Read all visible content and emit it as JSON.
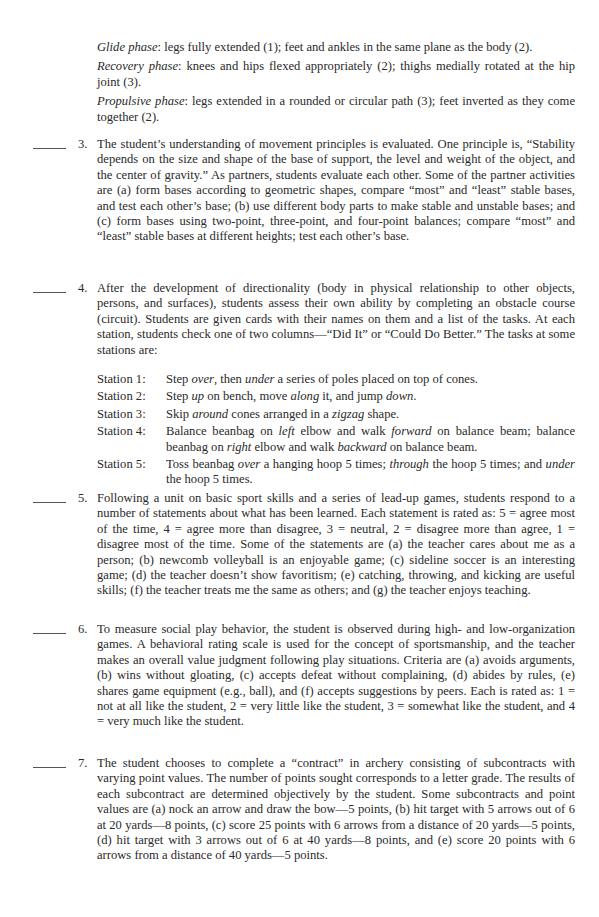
{
  "continuation": {
    "glide_label": "Glide phase",
    "glide_text": ": legs fully extended (1); feet and ankles in the same plane as the body (2).",
    "recovery_label": "Recovery phase",
    "recovery_text": ": knees and hips flexed appropriately (2); thighs medially rotated at the hip joint (3).",
    "propulsive_label": "Propulsive phase",
    "propulsive_text": ": legs extended in a rounded or circular path (3); feet inverted as they come together (2)."
  },
  "items": [
    {
      "number": "3.",
      "blank": "_____",
      "text": "The student’s understanding of movement principles is evaluated. One principle is, “Stability depends on the size and shape of the base of support, the level and weight of the object, and the center of gravity.” As partners, students evaluate each other. Some of the partner activities are (a) form bases according to geometric shapes, compare “most” and “least” stable bases, and test each other’s base; (b) use different body parts to make stable and unstable bases; and (c) form bases using two-point, three-point, and four-point balances; compare “most” and “least” stable bases at different heights; test each other’s base."
    },
    {
      "number": "4.",
      "blank": "_____",
      "text": "After the development of directionality (body in physical relationship to other objects, persons, and surfaces), students assess their own ability by completing an obstacle course (circuit). Students are given cards with their names on them and a list of the tasks. At each station, students check one of two columns—“Did It” or “Could Do Better.” The tasks at some stations are:",
      "stations": [
        {
          "label": "Station 1:",
          "parts": [
            "Step ",
            "over",
            ", then ",
            "under",
            " a series of poles placed on top of cones."
          ]
        },
        {
          "label": "Station 2:",
          "parts": [
            "Step ",
            "up",
            " on bench, move ",
            "along",
            " it, and jump ",
            "down",
            "."
          ]
        },
        {
          "label": "Station 3:",
          "parts": [
            "Skip ",
            "around",
            " cones arranged in a ",
            "zigzag",
            " shape."
          ]
        },
        {
          "label": "Station 4:",
          "parts": [
            "Balance beanbag on ",
            "left",
            " elbow and walk ",
            "forward",
            " on balance beam; balance beanbag on ",
            "right",
            " elbow and walk ",
            "backward",
            " on balance beam."
          ]
        },
        {
          "label": "Station 5:",
          "parts": [
            "Toss beanbag ",
            "over",
            " a hanging hoop 5 times; ",
            "through",
            " the hoop 5 times; and ",
            "under",
            " the hoop 5 times."
          ]
        }
      ]
    },
    {
      "number": "5.",
      "blank": "_____",
      "text": "Following a unit on basic sport skills and a series of lead-up games, students respond to a number of statements about what has been learned. Each statement is rated as: 5 = agree most of the time, 4 = agree more than disagree, 3 = neutral, 2 = disagree more than agree, 1 = disagree most of the time. Some of the statements are (a) the teacher cares about me as a person; (b) newcomb volleyball is an enjoyable game; (c) sideline soccer is an interesting game; (d) the teacher doesn’t show favoritism; (e) catching, throwing, and kicking are useful skills; (f) the teacher treats me the same as others; and (g) the teacher enjoys teaching."
    },
    {
      "number": "6.",
      "blank": "_____",
      "text": "To measure social play behavior, the student is observed during high- and low-organization games. A behavioral rating scale is used for the concept of sportsmanship, and the teacher makes an overall value judgment following play situations. Criteria are (a) avoids arguments, (b) wins without gloating, (c) accepts defeat without complaining, (d) abides by rules, (e) shares game equipment (e.g., ball), and (f) accepts suggestions by peers. Each is rated as: 1 = not at all like the student, 2 = very little like the student, 3 = somewhat like the student, and 4 = very much like the student."
    },
    {
      "number": "7.",
      "blank": "_____",
      "text": "The student chooses to complete a “contract” in archery consisting of subcontracts with varying point values. The number of points sought corresponds to a letter grade. The results of each subcontract are determined objectively by the student. Some subcontracts and point values are (a) nock an arrow and draw the bow—5 points, (b) hit target with 5 arrows out of 6 at 20 yards—8 points, (c) score 25 points with 6 arrows from a distance of 20 yards—5 points, (d) hit target with 3 arrows out of 6 at 40 yards—8 points, and (e) score 20 points with 6 arrows from a distance of 40 yards—5 points."
    }
  ]
}
